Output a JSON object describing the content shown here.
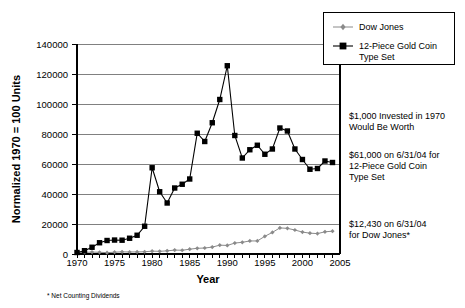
{
  "chart_data": {
    "type": "line",
    "title": "",
    "xlabel": "Year",
    "ylabel": "Normalized 1970 = 100 Units",
    "xlim": [
      1970,
      2005
    ],
    "ylim": [
      0,
      140000
    ],
    "xticks": [
      "1970",
      "1975",
      "1980",
      "1985",
      "1990",
      "1995",
      "2000",
      "2005"
    ],
    "yticks": [
      "0",
      "20000",
      "40000",
      "60000",
      "80000",
      "100000",
      "120000",
      "140000"
    ],
    "grid": "horizontal",
    "legend_position": "top-right",
    "x": [
      1970,
      1971,
      1972,
      1973,
      1974,
      1975,
      1976,
      1977,
      1978,
      1979,
      1980,
      1981,
      1982,
      1983,
      1984,
      1985,
      1986,
      1987,
      1988,
      1989,
      1990,
      1991,
      1992,
      1993,
      1994,
      1995,
      1996,
      1997,
      1998,
      1999,
      2000,
      2001,
      2002,
      2003,
      2004
    ],
    "series": [
      {
        "name": "12-Piece Gold Coin Type Set",
        "marker": "square",
        "color": "#000000",
        "values": [
          1000,
          2200,
          4500,
          7500,
          9000,
          9300,
          9200,
          10500,
          12500,
          18500,
          57500,
          41500,
          34000,
          44000,
          46500,
          50000,
          80500,
          75000,
          87500,
          103000,
          125500,
          79000,
          64000,
          69500,
          72500,
          66500,
          70000,
          84000,
          82000,
          70000,
          63000,
          56500,
          57000,
          62000,
          61000
        ]
      },
      {
        "name": "Dow Jones",
        "marker": "diamond",
        "color": "#8a8a8a",
        "values": [
          1000,
          1100,
          1300,
          1150,
          900,
          1200,
          1450,
          1350,
          1400,
          1500,
          1900,
          1800,
          2100,
          2600,
          2500,
          3200,
          3800,
          4000,
          4600,
          5900,
          5700,
          7300,
          7800,
          8700,
          8700,
          11800,
          14400,
          17400,
          17100,
          16000,
          14600,
          13900,
          13600,
          14800,
          15200
        ]
      }
    ],
    "annotations": [
      {
        "id": "worth-header",
        "lines": [
          "$1,000 Invested in 1970",
          "Would Be Worth"
        ]
      },
      {
        "id": "gold-value",
        "lines": [
          "$61,000 on 6/31/04 for",
          "12-Piece Gold Coin",
          "Type Set"
        ]
      },
      {
        "id": "dow-value",
        "lines": [
          "$12,430 on 6/31/04",
          "for Dow Jones*"
        ]
      }
    ],
    "footnote": "* Net Counting Dividends"
  },
  "legend": {
    "items": [
      {
        "label": "Dow Jones",
        "marker": "diamond-line",
        "color": "#8a8a8a"
      },
      {
        "label": "12-Piece Gold Coin",
        "label2": "Type Set",
        "marker": "square-line",
        "color": "#000000"
      }
    ]
  }
}
